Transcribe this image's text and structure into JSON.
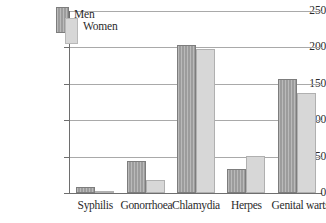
{
  "chart_data": {
    "type": "bar",
    "title": "",
    "subtitle": "",
    "xlabel": "",
    "ylabel": "",
    "ylim": [
      0,
      250
    ],
    "yticks": [
      0,
      50,
      100,
      150,
      200,
      250
    ],
    "ytick_labels": [
      "0",
      "50",
      "100",
      "150",
      "200",
      "250"
    ],
    "grid": true,
    "legend_position": "top-left-inside",
    "categories": [
      "Syphilis",
      "Gonorrhoea",
      "Chlamydia",
      "Herpes",
      "Genital warts"
    ],
    "series": [
      {
        "name": "Men",
        "color": "#9c9c9c",
        "values": [
          8,
          44,
          204,
          33,
          157
        ]
      },
      {
        "name": "Women",
        "color": "#d7d7d7",
        "values": [
          1,
          18,
          198,
          51,
          137
        ]
      }
    ]
  },
  "legend": {
    "items": [
      {
        "label": "Men"
      },
      {
        "label": "Women"
      }
    ]
  },
  "colors": {
    "men_fill": "#9c9c9c",
    "women_fill": "#d7d7d7",
    "gridline": "#a9a9a9",
    "axis": "#6e6e6e",
    "text": "#2b2b2b",
    "background": "#ffffff"
  }
}
